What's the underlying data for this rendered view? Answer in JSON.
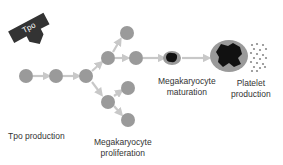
{
  "diagram": {
    "tpo_arrow": {
      "label": "Tpo",
      "color": "#333333",
      "text_color": "#ffffff"
    },
    "colors": {
      "cell": "#9a9a9a",
      "arrow": "#c8c8c8",
      "nucleus": "#111111",
      "platelet": "#8a8a8a"
    },
    "stages": [
      {
        "id": "tpo-production",
        "label": "Tpo production"
      },
      {
        "id": "megakaryocyte-proliferation",
        "label_line1": "Megakaryocyte",
        "label_line2": "proliferation"
      },
      {
        "id": "megakaryocyte-maturation",
        "label_line1": "Megakaryocyte",
        "label_line2": "maturation"
      },
      {
        "id": "platelet-production",
        "label_line1": "Platelet",
        "label_line2": "production"
      }
    ]
  }
}
